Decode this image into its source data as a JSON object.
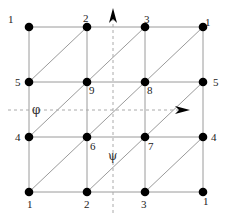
{
  "diagram": {
    "type": "periodic-triangulated-grid",
    "grid": {
      "xs": [
        29,
        87,
        145,
        203
      ],
      "ys": [
        27,
        82,
        137,
        192
      ],
      "line_color": "#9a9a9a",
      "node_color": "#000000"
    },
    "nodes": [
      {
        "id": "n-0-0",
        "label": "1",
        "col": 0,
        "row": 0,
        "lx": 8,
        "ly": 23,
        "anchor": "start"
      },
      {
        "id": "n-1-0",
        "label": "2",
        "col": 1,
        "row": 0,
        "lx": 83,
        "ly": 22,
        "anchor": "start"
      },
      {
        "id": "n-2-0",
        "label": "3",
        "col": 2,
        "row": 0,
        "lx": 144,
        "ly": 23,
        "anchor": "start"
      },
      {
        "id": "n-3-0",
        "label": "1",
        "col": 3,
        "row": 0,
        "lx": 205,
        "ly": 26,
        "anchor": "start"
      },
      {
        "id": "n-0-1",
        "label": "5",
        "col": 0,
        "row": 1,
        "lx": 15,
        "ly": 86,
        "anchor": "start"
      },
      {
        "id": "n-1-1",
        "label": "9",
        "col": 1,
        "row": 1,
        "lx": 89,
        "ly": 94,
        "anchor": "start"
      },
      {
        "id": "n-2-1",
        "label": "8",
        "col": 2,
        "row": 1,
        "lx": 147,
        "ly": 94,
        "anchor": "start"
      },
      {
        "id": "n-3-1",
        "label": "5",
        "col": 3,
        "row": 1,
        "lx": 213,
        "ly": 86,
        "anchor": "start"
      },
      {
        "id": "n-0-2",
        "label": "4",
        "col": 0,
        "row": 2,
        "lx": 15,
        "ly": 141,
        "anchor": "start"
      },
      {
        "id": "n-1-2",
        "label": "6",
        "col": 1,
        "row": 2,
        "lx": 90,
        "ly": 150,
        "anchor": "start"
      },
      {
        "id": "n-2-2",
        "label": "7",
        "col": 2,
        "row": 2,
        "lx": 148,
        "ly": 150,
        "anchor": "start"
      },
      {
        "id": "n-3-2",
        "label": "4",
        "col": 3,
        "row": 2,
        "lx": 211,
        "ly": 141,
        "anchor": "start"
      },
      {
        "id": "n-0-3",
        "label": "1",
        "col": 0,
        "row": 3,
        "lx": 27,
        "ly": 208,
        "anchor": "start"
      },
      {
        "id": "n-1-3",
        "label": "2",
        "col": 1,
        "row": 3,
        "lx": 84,
        "ly": 208,
        "anchor": "start"
      },
      {
        "id": "n-2-3",
        "label": "3",
        "col": 2,
        "row": 3,
        "lx": 141,
        "ly": 208,
        "anchor": "start"
      },
      {
        "id": "n-3-3",
        "label": "1",
        "col": 3,
        "row": 3,
        "lx": 203,
        "ly": 205,
        "anchor": "start"
      }
    ],
    "axes": {
      "psi": {
        "symbol": "ψ",
        "label_x": 108,
        "label_y": 160,
        "direction": "up",
        "x": 113,
        "y_start": 213,
        "y_end": 8
      },
      "phi": {
        "symbol": "φ",
        "label_x": 32,
        "label_y": 114,
        "direction": "right",
        "y": 110,
        "x_start": 8,
        "x_end": 190
      },
      "dash_color": "#aaaaaa"
    }
  }
}
